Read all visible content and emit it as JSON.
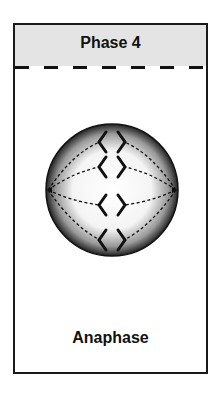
{
  "card": {
    "header_title": "Phase 4",
    "footer_label": "Anaphase"
  },
  "diagram": {
    "chromosome_pairs": 4,
    "spindle_poles": 2,
    "colors": {
      "header_bg": "#e4e4e4",
      "outline": "#111111"
    }
  }
}
